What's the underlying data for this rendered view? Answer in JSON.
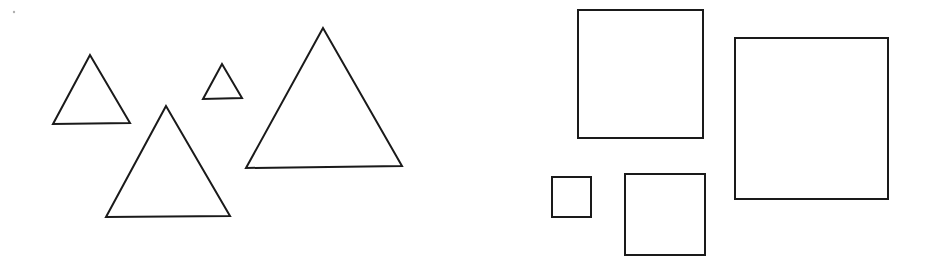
{
  "diagram": {
    "background": "#ffffff",
    "stroke_color": "#1a1a1a",
    "groups": [
      {
        "name": "triangles",
        "shapes": [
          {
            "id": "triangle-small-left",
            "points": "90,55 53,124 130,123"
          },
          {
            "id": "triangle-tiny",
            "points": "222,64 203,99 242,98"
          },
          {
            "id": "triangle-medium",
            "points": "166,106 106,217 230,216"
          },
          {
            "id": "triangle-large",
            "points": "323,28 246,168 402,166"
          }
        ]
      },
      {
        "name": "squares",
        "shapes": [
          {
            "id": "square-top-middle",
            "x": 578,
            "y": 10,
            "w": 125,
            "h": 128
          },
          {
            "id": "square-large-right",
            "x": 735,
            "y": 38,
            "w": 153,
            "h": 161
          },
          {
            "id": "square-tiny",
            "x": 552,
            "y": 177,
            "w": 39,
            "h": 40
          },
          {
            "id": "square-bottom-middle",
            "x": 625,
            "y": 174,
            "w": 80,
            "h": 81
          }
        ]
      }
    ]
  }
}
